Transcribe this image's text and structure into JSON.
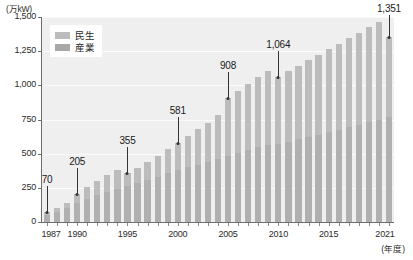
{
  "chart_data": {
    "type": "bar",
    "title": "",
    "subtitle": "",
    "xlabel": "(年度)",
    "ylabel": "(万kW)",
    "unit_top_left": "(万kW)",
    "grid": true,
    "legend_position": "top-left",
    "stacked": true,
    "ylim": [
      0,
      1500
    ],
    "ytick_labels": [
      "1,500",
      "1,250",
      "1,000",
      "750",
      "500",
      "250",
      "0"
    ],
    "ytick_values": [
      1500,
      1250,
      1000,
      750,
      500,
      250,
      0
    ],
    "xtick_labels": [
      "1987",
      "1990",
      "1995",
      "2000",
      "2005",
      "2010",
      "2015",
      "2021"
    ],
    "xtick_values": [
      1987,
      1990,
      1995,
      2000,
      2005,
      2010,
      2015,
      2021
    ],
    "categories": [
      "1987",
      "1988",
      "1989",
      "1990",
      "1991",
      "1992",
      "1993",
      "1994",
      "1995",
      "1996",
      "1997",
      "1998",
      "1999",
      "2000",
      "2001",
      "2002",
      "2003",
      "2004",
      "2005",
      "2006",
      "2007",
      "2008",
      "2009",
      "2010",
      "2011",
      "2012",
      "2013",
      "2014",
      "2015",
      "2016",
      "2017",
      "2018",
      "2019",
      "2020",
      "2021"
    ],
    "series": [
      {
        "name": "産業",
        "color": "#b0b0b0",
        "values": [
          52,
          74,
          102,
          136,
          168,
          196,
          222,
          244,
          264,
          284,
          306,
          330,
          356,
          382,
          402,
          420,
          440,
          462,
          486,
          508,
          528,
          546,
          560,
          572,
          588,
          604,
          622,
          640,
          658,
          676,
          694,
          712,
          730,
          748,
          766
        ]
      },
      {
        "name": "民生",
        "color": "#bcbcbc",
        "values": [
          18,
          26,
          36,
          69,
          86,
          104,
          121,
          136,
          91,
          111,
          132,
          154,
          176,
          199,
          229,
          258,
          288,
          320,
          422,
          452,
          482,
          512,
          542,
          492,
          516,
          540,
          562,
          584,
          606,
          628,
          650,
          672,
          694,
          716,
          585
        ]
      }
    ],
    "totals": [
      70,
      100,
      138,
      205,
      254,
      300,
      343,
      380,
      355,
      395,
      438,
      484,
      532,
      581,
      631,
      678,
      728,
      782,
      908,
      960,
      1010,
      1058,
      1102,
      1064,
      1104,
      1144,
      1184,
      1224,
      1264,
      1304,
      1344,
      1384,
      1424,
      1464,
      1351
    ],
    "annotations": [
      {
        "year": "1987",
        "index": 0,
        "value": 70,
        "label": "70"
      },
      {
        "year": "1990",
        "index": 3,
        "value": 205,
        "label": "205"
      },
      {
        "year": "1995",
        "index": 8,
        "value": 355,
        "label": "355"
      },
      {
        "year": "2000",
        "index": 13,
        "value": 581,
        "label": "581"
      },
      {
        "year": "2005",
        "index": 18,
        "value": 908,
        "label": "908"
      },
      {
        "year": "2010",
        "index": 23,
        "value": 1064,
        "label": "1,064"
      },
      {
        "year": "2021",
        "index": 34,
        "value": 1351,
        "label": "1,351"
      }
    ]
  },
  "legend": {
    "items": [
      {
        "label": "民生",
        "swatch": "residential"
      },
      {
        "label": "産業",
        "swatch": "industry"
      }
    ]
  }
}
